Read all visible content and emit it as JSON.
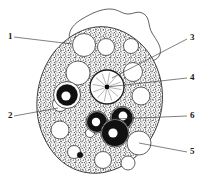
{
  "figure": {
    "background_color": "#ffffff",
    "ink_color": "#1a1a1a",
    "cytoplasm_fill": "#b8b8b8",
    "vacuole_fill": "#ffffff",
    "inclusion_fill": "#111111"
  },
  "labels": [
    {
      "id": "1",
      "text": "1",
      "text_x": 8,
      "text_y": 37,
      "line_x1": 14,
      "line_y1": 37,
      "line_x2": 72,
      "line_y2": 44,
      "side": "left",
      "target": "outer-membrane"
    },
    {
      "id": "2",
      "text": "2",
      "text_x": 8,
      "text_y": 116,
      "line_x1": 14,
      "line_y1": 116,
      "line_x2": 58,
      "line_y2": 108,
      "side": "left",
      "target": "cytoplasm"
    },
    {
      "id": "3",
      "text": "3",
      "text_x": 190,
      "text_y": 38,
      "line_x1": 187,
      "line_y1": 39,
      "line_x2": 112,
      "line_y2": 78,
      "side": "right",
      "target": "nuclear-membrane"
    },
    {
      "id": "4",
      "text": "4",
      "text_x": 190,
      "text_y": 78,
      "line_x1": 187,
      "line_y1": 78,
      "line_x2": 107,
      "line_y2": 87,
      "side": "right",
      "target": "karyosome"
    },
    {
      "id": "5",
      "text": "5",
      "text_x": 190,
      "text_y": 152,
      "line_x1": 187,
      "line_y1": 152,
      "line_x2": 139,
      "line_y2": 143,
      "side": "right",
      "target": "clear-vacuole"
    },
    {
      "id": "6",
      "text": "6",
      "text_x": 190,
      "text_y": 116,
      "line_x1": 187,
      "line_y1": 116,
      "line_x2": 114,
      "line_y2": 119,
      "side": "right",
      "target": "dark-inclusion"
    }
  ],
  "structures": {
    "outer_membrane_path": "M 72 45 C 66 36 70 26 82 19 C 92 13 101 9 110 9 C 118 9 122 14 128 14 C 134 14 138 10 144 14 C 150 18 148 26 152 33 C 157 41 162 47 160 54 C 158 60 151 62 147 61",
    "cell_body_path": "M 96 27 C 112 25 128 32 140 43 C 152 54 160 70 162 88 C 164 106 160 124 150 140 C 140 156 124 168 106 172 C 88 176 70 170 58 158 C 46 146 38 128 37 110 C 36 92 40 74 50 58 C 60 42 78 29 96 27 Z",
    "nucleus": {
      "cx": 107,
      "cy": 87,
      "r": 17,
      "inner_r": 14.5,
      "karyosome_r": 2.4,
      "spokes": 12
    },
    "clear_vacuoles": [
      {
        "cx": 84,
        "cy": 45,
        "r": 11.5
      },
      {
        "cx": 106,
        "cy": 47,
        "r": 8.5
      },
      {
        "cx": 131,
        "cy": 46,
        "r": 7.5
      },
      {
        "cx": 78,
        "cy": 73,
        "r": 12.0
      },
      {
        "cx": 133,
        "cy": 72,
        "r": 9.5
      },
      {
        "cx": 141,
        "cy": 96,
        "r": 9.0
      },
      {
        "cx": 60,
        "cy": 104,
        "r": 7.5
      },
      {
        "cx": 60,
        "cy": 130,
        "r": 9.0
      },
      {
        "cx": 139,
        "cy": 143,
        "r": 12.0
      },
      {
        "cx": 74,
        "cy": 152,
        "r": 6.5
      },
      {
        "cx": 103,
        "cy": 160,
        "r": 8.5
      },
      {
        "cx": 128,
        "cy": 163,
        "r": 7.0
      },
      {
        "cx": 90,
        "cy": 133,
        "r": 4.5
      }
    ],
    "dark_inclusions": [
      {
        "cx": 67,
        "cy": 95,
        "r_outer": 13.5,
        "r_core": 10.5,
        "hole_cx": 66,
        "hole_cy": 96,
        "hole_r": 4.6
      },
      {
        "cx": 97,
        "cy": 122,
        "r_outer": 11.0,
        "r_core": 10.0,
        "hole_cx": 96,
        "hole_cy": 122,
        "hole_r": 4.2
      },
      {
        "cx": 122,
        "cy": 118,
        "r_outer": 11.5,
        "r_core": 10.5,
        "hole_cx": 123,
        "hole_cy": 116,
        "hole_r": 4.4
      },
      {
        "cx": 115,
        "cy": 133,
        "r_outer": 14.0,
        "r_core": 13.0,
        "hole_cx": 113,
        "hole_cy": 133,
        "hole_r": 4.6
      }
    ],
    "dark_dot": {
      "cx": 80,
      "cy": 155,
      "r": 2.8
    }
  }
}
